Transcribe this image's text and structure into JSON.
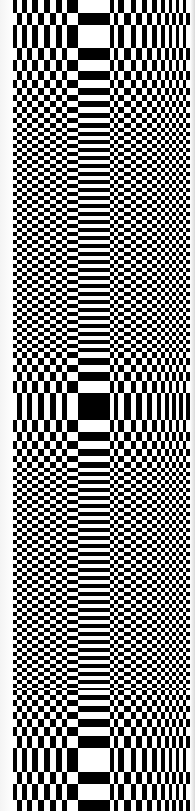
{
  "image": {
    "description": "Black and white XOR stripe / checkerboard moire pattern",
    "width": 195,
    "height": 811,
    "colors": {
      "on": "#000000",
      "off": "#ffffff"
    },
    "left_margin": 13,
    "right_margin": 5
  },
  "columns": {
    "boundaries": [
      13,
      17,
      22,
      27,
      32,
      38,
      44,
      50,
      56,
      62,
      67,
      78,
      110,
      114,
      118,
      124,
      131,
      136,
      142,
      147,
      152,
      157,
      161,
      165,
      169,
      172,
      176,
      179,
      183,
      186,
      190
    ],
    "first_on": true
  },
  "rows": {
    "top_boundaries": [
      0,
      13,
      25,
      48,
      60,
      71,
      80,
      88,
      95,
      101,
      107,
      113,
      118,
      123,
      128
    ],
    "middle_boundaries": [
      352,
      358,
      365,
      372,
      381,
      393,
      420,
      432,
      441,
      449,
      456,
      462,
      468
    ],
    "bottom_boundaries": [
      690,
      695,
      700,
      706,
      712,
      719,
      727,
      736,
      748,
      772,
      784,
      800,
      811
    ],
    "fine_step": 4,
    "top_band_on": false
  }
}
